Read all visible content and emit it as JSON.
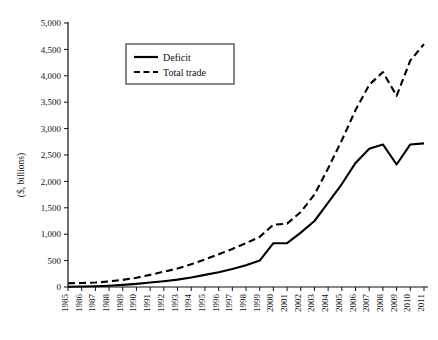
{
  "chart_data": {
    "type": "line",
    "title": "",
    "xlabel": "",
    "ylabel": "($, billions)",
    "ylim": [
      0,
      5000
    ],
    "ytick_step": 500,
    "grid": false,
    "legend_position": "top-left-inside",
    "ytick_labels": [
      "0",
      "500",
      "1,000",
      "1,500",
      "2,000",
      "2,500",
      "3,000",
      "3,500",
      "4,000",
      "4,500",
      "5,000"
    ],
    "categories": [
      "1985",
      "1986",
      "1987",
      "1988",
      "1989",
      "1990",
      "1991",
      "1992",
      "1993",
      "1994",
      "1995",
      "1996",
      "1997",
      "1998",
      "1999",
      "2000",
      "2001",
      "2002",
      "2003",
      "2004",
      "2005",
      "2006",
      "2007",
      "2008",
      "2009",
      "2010",
      "2011"
    ],
    "series": [
      {
        "name": "Deficit",
        "style": "solid",
        "color": "#000000",
        "values": [
          6,
          10,
          15,
          25,
          40,
          60,
          85,
          110,
          140,
          180,
          230,
          280,
          340,
          410,
          500,
          830,
          830,
          1030,
          1250,
          1600,
          1950,
          2350,
          2620,
          2700,
          2320,
          2700,
          2720
        ]
      },
      {
        "name": "Total trade",
        "style": "dashed",
        "color": "#000000",
        "values": [
          70,
          75,
          85,
          105,
          135,
          175,
          230,
          290,
          350,
          430,
          520,
          620,
          720,
          830,
          950,
          1180,
          1200,
          1420,
          1750,
          2250,
          2780,
          3350,
          3830,
          4070,
          3620,
          4290,
          4600
        ]
      }
    ]
  },
  "legend": {
    "items": [
      {
        "label": "Deficit",
        "style": "solid"
      },
      {
        "label": "Total trade",
        "style": "dashed"
      }
    ]
  }
}
